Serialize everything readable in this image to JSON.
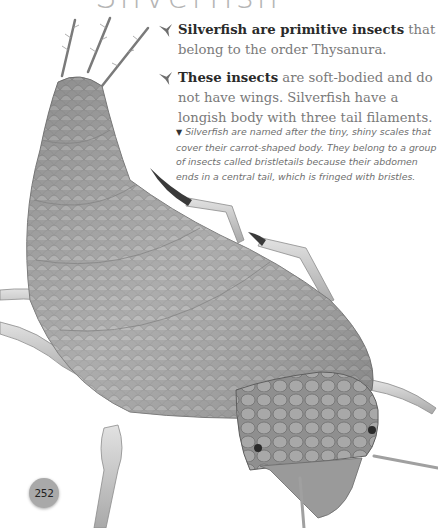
{
  "page": {
    "title": "Silverfish",
    "page_number": "252"
  },
  "bullets": [
    {
      "icon": "bird-bullet-icon",
      "bold": "Silverfish are primitive insects",
      "text": " that belong to the order Thysanura."
    },
    {
      "icon": "bird-bullet-icon",
      "bold": "These insects",
      "text": " are soft-bodied and do not have wings. Silverfish have a longish body with three tail filaments."
    }
  ],
  "caption": {
    "marker": "▼",
    "text": "Silverfish are named after the tiny, shiny scales that cover their carrot-shaped body. They belong to a group of insects called bristletails because their abdomen ends in a central tail, which is fringed with bristles."
  },
  "illustration": {
    "subject": "silverfish-insect",
    "colors": {
      "body": "#9a9a9a",
      "body_light": "#bdbdbd",
      "body_dark": "#6e6e6e",
      "legs": "#c8c8c8",
      "claws": "#3a3a3a"
    }
  }
}
